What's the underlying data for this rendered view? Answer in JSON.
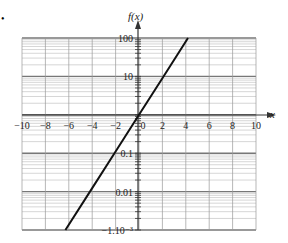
{
  "chart_data": {
    "type": "line",
    "title": "",
    "xlabel": "x",
    "ylabel": "f(x)",
    "yscale": "log",
    "xlim": [
      -10,
      10
    ],
    "ylim": [
      0.001,
      100
    ],
    "x_ticks": [
      -10,
      -8,
      -6,
      -4,
      -2,
      0,
      2,
      4,
      6,
      8,
      10
    ],
    "x_tick_labels": [
      "−10",
      "−8",
      "−6",
      "−4",
      "−2",
      "0",
      "2",
      "4",
      "6",
      "8",
      "10"
    ],
    "y_ticks": [
      100,
      10,
      0.1,
      0.01,
      0.001
    ],
    "y_tick_labels": [
      "100",
      "10",
      "0.1",
      "0.01",
      "−1.10⁻³"
    ],
    "grid": true,
    "legend": null,
    "series": [
      {
        "name": "f(x)",
        "x": [
          -6.29,
          -4,
          -2,
          0,
          2,
          4,
          4.19
        ],
        "y": [
          0.001,
          0.0123,
          0.111,
          1,
          9,
          81,
          100
        ]
      }
    ]
  },
  "labels": {
    "bullet": "•",
    "y_axis_title": "f(x)",
    "x_axis_title": "x"
  }
}
